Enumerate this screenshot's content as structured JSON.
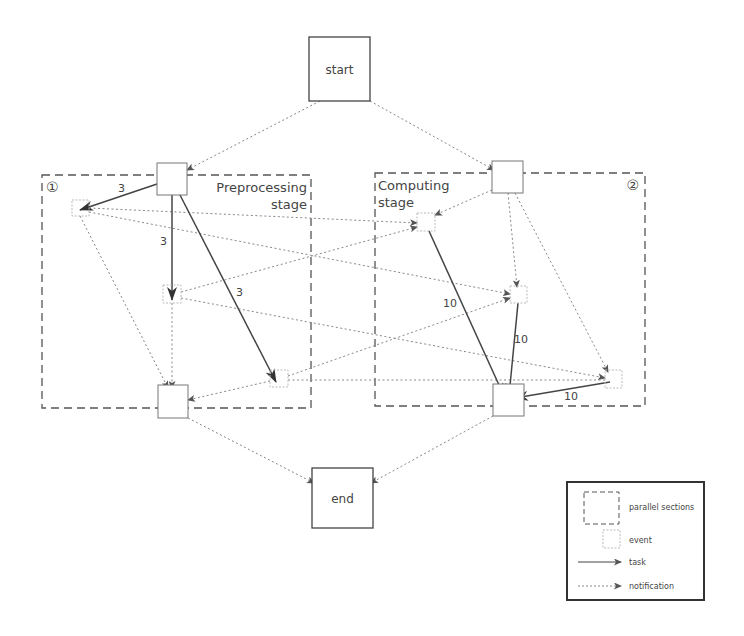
{
  "diagram": {
    "start_label": "start",
    "end_label": "end",
    "sections": [
      {
        "id": "section-1",
        "marker": "①",
        "title_line1": "Preprocessing",
        "title_line2": "stage"
      },
      {
        "id": "section-2",
        "marker": "②",
        "title_line1": "Computing",
        "title_line2": "stage"
      }
    ],
    "task_weights": {
      "a_to_e1": "3",
      "a_to_e2": "3",
      "a_to_e3": "3",
      "e4_to_join2": "10",
      "e5_to_join2": "10",
      "e6_to_join2": "10"
    }
  },
  "legend": {
    "parallel_sections": "parallel sections",
    "event": "event",
    "task": "task",
    "notification": "notification"
  },
  "colors": {
    "task_line": "#444444",
    "notification_line": "#888888",
    "box_border": "#555555",
    "event_border": "#aaaaaa"
  }
}
